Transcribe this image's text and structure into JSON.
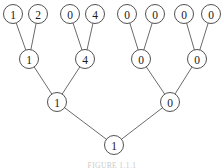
{
  "figure": {
    "type": "binary-tree-diagram",
    "caption": "FIGURE 1.1.1",
    "width": 224,
    "height": 168,
    "background_color": "#ffffff",
    "node_stroke_color": "#3d3d3d",
    "node_fill_color": "#ffffff",
    "edge_color": "#5a5a5a",
    "label_color": "#1a1a1a",
    "node_radius": 9.5
  },
  "tree": {
    "levels": [
      {
        "level": 0,
        "name": "leaf-level",
        "y": 14,
        "nodes": [
          {
            "id": "L0",
            "value": "1",
            "x": 13
          },
          {
            "id": "L1",
            "value": "2",
            "x": 38
          },
          {
            "id": "L2",
            "value": "0",
            "x": 70
          },
          {
            "id": "L3",
            "value": "4",
            "x": 95
          },
          {
            "id": "L4",
            "value": "0",
            "x": 127
          },
          {
            "id": "L5",
            "value": "0",
            "x": 155
          },
          {
            "id": "L6",
            "value": "0",
            "x": 184
          },
          {
            "id": "L7",
            "value": "0",
            "x": 211
          }
        ]
      },
      {
        "level": 1,
        "name": "internal-level-1",
        "y": 59,
        "nodes": [
          {
            "id": "I0",
            "value": "1",
            "x": 29
          },
          {
            "id": "I1",
            "value": "4",
            "x": 85
          },
          {
            "id": "I2",
            "value": "0",
            "x": 141
          },
          {
            "id": "I3",
            "value": "0",
            "x": 197
          }
        ]
      },
      {
        "level": 2,
        "name": "internal-level-2",
        "y": 102,
        "nodes": [
          {
            "id": "J0",
            "value": "1",
            "x": 57
          },
          {
            "id": "J1",
            "value": "0",
            "x": 170
          }
        ]
      },
      {
        "level": 3,
        "name": "root-level",
        "y": 145,
        "nodes": [
          {
            "id": "R0",
            "value": "1",
            "x": 114
          }
        ]
      }
    ],
    "edges": [
      {
        "from": "L0",
        "to": "I0"
      },
      {
        "from": "L1",
        "to": "I0"
      },
      {
        "from": "L2",
        "to": "I1"
      },
      {
        "from": "L3",
        "to": "I1"
      },
      {
        "from": "L4",
        "to": "I2"
      },
      {
        "from": "L5",
        "to": "I2"
      },
      {
        "from": "L6",
        "to": "I3"
      },
      {
        "from": "L7",
        "to": "I3"
      },
      {
        "from": "I0",
        "to": "J0"
      },
      {
        "from": "I1",
        "to": "J0"
      },
      {
        "from": "I2",
        "to": "J1"
      },
      {
        "from": "I3",
        "to": "J1"
      },
      {
        "from": "J0",
        "to": "R0"
      },
      {
        "from": "J1",
        "to": "R0"
      }
    ]
  }
}
